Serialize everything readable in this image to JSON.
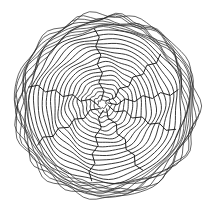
{
  "illustration": {
    "subject": "tree stump cross-section",
    "style": "black line art on white",
    "stroke_color": "#222222",
    "background_color": "#ffffff",
    "center": [
      106,
      106
    ],
    "bark_outer_radius": 92,
    "bark_inner_radius": 78,
    "ring_count": 18,
    "crack_count": 8
  }
}
